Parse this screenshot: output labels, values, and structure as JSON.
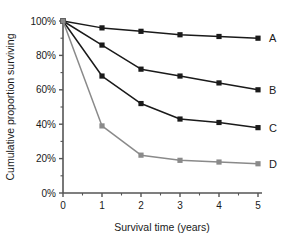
{
  "chart_data": {
    "type": "line",
    "title": "",
    "xlabel": "Survival time (years)",
    "ylabel": "Cumulative proportion surviving",
    "x": [
      0,
      1,
      2,
      3,
      4,
      5
    ],
    "xlim": [
      0,
      5
    ],
    "ylim": [
      0,
      100
    ],
    "xticks": [
      0,
      1,
      2,
      3,
      4,
      5
    ],
    "xtick_labels": [
      "0",
      "1",
      "2",
      "3",
      "4",
      "5"
    ],
    "yticks": [
      0,
      20,
      40,
      60,
      80,
      100
    ],
    "ytick_labels": [
      "0%",
      "20%",
      "40%",
      "60%",
      "80%",
      "100%"
    ],
    "y_minor_ticks": [
      10,
      30,
      50,
      70,
      90
    ],
    "x_minor_ticks": [
      0.5,
      1.5,
      2.5,
      3.5,
      4.5
    ],
    "grid": false,
    "legend_position": "right-end-of-line",
    "series": [
      {
        "name": "A",
        "label": "A",
        "color": "#1a1a1a",
        "marker": "square",
        "values": [
          100,
          96,
          94,
          92,
          91,
          90
        ]
      },
      {
        "name": "B",
        "label": "B",
        "color": "#1a1a1a",
        "marker": "square",
        "values": [
          100,
          86,
          72,
          68,
          64,
          60
        ]
      },
      {
        "name": "C",
        "label": "C",
        "color": "#1a1a1a",
        "marker": "square",
        "values": [
          100,
          68,
          52,
          43,
          41,
          38
        ]
      },
      {
        "name": "D",
        "label": "D",
        "color": "#8a8a8a",
        "marker": "square",
        "values": [
          100,
          39,
          22,
          19,
          18,
          17
        ]
      }
    ]
  },
  "axis": {
    "line_color": "#555555",
    "x_title": "Survival time (years)",
    "y_title": "Cumulative proportion surviving"
  }
}
